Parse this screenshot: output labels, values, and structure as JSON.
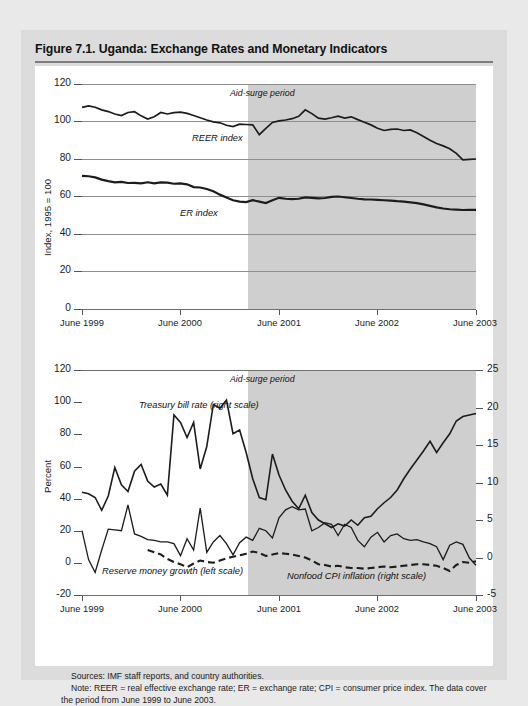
{
  "figure": {
    "title": "Figure 7.1. Uganda: Exchange Rates and Monetary Indicators",
    "sources_note": "Sources: IMF staff reports, and country authorities.",
    "general_note": "Note: REER = real effective exchange rate; ER = exchange rate; CPI = consumer price index. The data cover the period from June 1999 to June 2003.",
    "colors": {
      "page_background": "#e9e9e9",
      "figure_background": "#dcdcdc",
      "plot_background": "#ffffff",
      "shaded_region": "#cfcfcf",
      "line": "#1c1c1c",
      "gridline": "#8d8d8d"
    }
  },
  "chart_data": [
    {
      "type": "line",
      "title": "Uganda: Exchange Rates (Index, 1995 = 100)",
      "xlabel": "",
      "ylabel": "Index, 1995 = 100",
      "ylim": [
        0,
        120
      ],
      "yticks": [
        0,
        20,
        40,
        60,
        80,
        100,
        120
      ],
      "xticklabels": [
        "June 1999",
        "June 2000",
        "June 2001",
        "June 2002",
        "June 2003"
      ],
      "xlim": [
        "June 1999",
        "June 2003"
      ],
      "grid": true,
      "annotations": [
        {
          "text": "Aid-surge period",
          "x": "Dec 2001",
          "y": 115
        },
        {
          "text": "REER index",
          "x": "Feb 2000",
          "y": 92
        },
        {
          "text": "ER index",
          "x": "Jan 2000",
          "y": 54
        }
      ],
      "shaded_region": {
        "label": "Aid-surge period",
        "from": "Dec 2000",
        "to": "June 2003"
      },
      "series": [
        {
          "name": "REER index",
          "scale": "left",
          "values": [
            107.5,
            108.3,
            107.6,
            106.2,
            105.3,
            104.0,
            103.2,
            104.8,
            105.2,
            103.0,
            101.3,
            102.5,
            104.8,
            104.0,
            104.7,
            105.0,
            104.3,
            103.2,
            102.0,
            100.8,
            99.8,
            99.3,
            98.0,
            97.3,
            98.6,
            98.4,
            98.2,
            93.0,
            96.3,
            99.5,
            100.3,
            100.8,
            101.5,
            102.8,
            106.2,
            104.2,
            101.8,
            101.3,
            102.0,
            102.8,
            101.8,
            102.5,
            101.0,
            99.6,
            98.2,
            96.4,
            95.2,
            95.8,
            96.0,
            95.2,
            95.5,
            94.0,
            92.0,
            90.0,
            88.3,
            87.0,
            85.5,
            83.0,
            79.5,
            79.8,
            80.0
          ]
        },
        {
          "name": "ER index",
          "scale": "left",
          "values": [
            71.0,
            70.8,
            70.2,
            69.0,
            68.2,
            67.5,
            67.8,
            67.2,
            67.3,
            67.0,
            67.6,
            67.0,
            67.5,
            67.4,
            66.8,
            67.0,
            66.5,
            65.0,
            64.8,
            64.0,
            62.8,
            61.0,
            59.5,
            58.0,
            57.3,
            57.0,
            58.0,
            57.3,
            56.5,
            58.0,
            59.3,
            58.8,
            58.6,
            58.8,
            59.5,
            59.3,
            59.0,
            59.2,
            59.8,
            60.0,
            59.6,
            59.2,
            58.8,
            58.5,
            58.4,
            58.2,
            58.0,
            57.8,
            57.5,
            57.3,
            56.9,
            56.5,
            55.8,
            55.0,
            54.2,
            53.6,
            53.2,
            53.0,
            52.8,
            52.9,
            52.9
          ]
        }
      ]
    },
    {
      "type": "line",
      "title": "Uganda: Monetary Indicators (Percent)",
      "xlabel": "",
      "ylabel": "Percent",
      "ylim": [
        -20,
        120
      ],
      "yticks": [
        -20,
        0,
        20,
        40,
        60,
        80,
        100,
        120
      ],
      "ylim_right": [
        -5,
        25
      ],
      "yticks_right": [
        -5,
        0,
        5,
        10,
        15,
        20,
        25
      ],
      "xticklabels": [
        "June 1999",
        "June 2000",
        "June 2001",
        "June 2002",
        "June 2003"
      ],
      "grid": false,
      "annotations": [
        {
          "text": "Aid-surge period",
          "x": "Dec 2001",
          "y": 115
        },
        {
          "text": "Treasury bill rate (right scale)",
          "x": "Oct 1999",
          "y": 97
        },
        {
          "text": "Reserve money growth (left scale)",
          "x": "Aug 1999",
          "y": -10
        },
        {
          "text": "Nonfood CPI inflation (right scale)",
          "x": "Jan 2002",
          "y": -13
        }
      ],
      "shaded_region": {
        "label": "Aid-surge period",
        "from": "Dec 2000",
        "to": "June 2003"
      },
      "series": [
        {
          "name": "Treasury bill rate (right scale)",
          "scale": "right",
          "style": "solid",
          "values": [
            8.7,
            8.5,
            8.0,
            6.3,
            8.2,
            12.0,
            9.7,
            8.8,
            11.5,
            12.4,
            10.2,
            9.4,
            9.8,
            8.3,
            19.0,
            18.0,
            16.0,
            18.0,
            11.8,
            14.8,
            20.4,
            19.9,
            21.0,
            16.5,
            17.0,
            14.0,
            10.5,
            8.0,
            7.7,
            13.8,
            11.0,
            9.0,
            7.5,
            6.5,
            8.3,
            6.0,
            5.0,
            4.5,
            4.0,
            4.5,
            4.2,
            5.0,
            4.3,
            5.3,
            5.5,
            6.5,
            7.3,
            8.0,
            9.0,
            10.5,
            11.8,
            13.0,
            14.2,
            15.5,
            14.0,
            15.3,
            16.5,
            18.2,
            18.8,
            19.0,
            19.2
          ]
        },
        {
          "name": "Reserve money growth (left scale)",
          "scale": "left",
          "style": "solid",
          "values": [
            20.0,
            2.0,
            -6.0,
            8.0,
            21.0,
            20.5,
            20.0,
            36.0,
            18.0,
            16.5,
            14.5,
            14.0,
            13.0,
            13.0,
            12.0,
            4.5,
            15.0,
            8.0,
            34.0,
            6.5,
            13.0,
            17.0,
            12.0,
            5.0,
            12.5,
            16.0,
            14.0,
            21.5,
            20.0,
            15.5,
            28.0,
            33.0,
            35.0,
            33.0,
            33.5,
            20.0,
            22.0,
            25.0,
            24.0,
            17.0,
            24.0,
            22.0,
            14.0,
            10.0,
            16.0,
            19.0,
            13.0,
            17.0,
            18.0,
            15.0,
            14.0,
            14.5,
            13.0,
            12.0,
            10.0,
            2.0,
            11.0,
            13.0,
            11.5,
            3.0,
            -1.5
          ]
        },
        {
          "name": "Nonfood CPI inflation (right scale)",
          "scale": "right",
          "style": "dashed",
          "values": [
            null,
            null,
            null,
            null,
            null,
            null,
            null,
            null,
            null,
            null,
            1.0,
            0.7,
            0.4,
            -0.2,
            -0.6,
            -0.9,
            -1.3,
            -0.8,
            -0.4,
            -0.6,
            -0.7,
            -0.4,
            -0.1,
            0.1,
            0.3,
            0.5,
            0.8,
            0.6,
            0.2,
            0.4,
            0.6,
            0.5,
            0.4,
            0.2,
            0.0,
            -0.4,
            -0.9,
            -1.0,
            -1.2,
            -1.1,
            -1.3,
            -1.4,
            -1.4,
            -1.5,
            -1.4,
            -1.3,
            -1.2,
            -1.3,
            -1.2,
            -1.1,
            -1.0,
            -0.9,
            -0.9,
            -1.0,
            -1.1,
            -1.4,
            -1.8,
            -1.0,
            -0.6,
            -0.7,
            -0.5
          ]
        }
      ]
    }
  ]
}
